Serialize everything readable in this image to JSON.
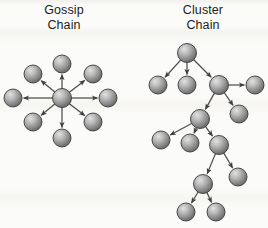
{
  "figure": {
    "background_color": "#fbfbf9",
    "node_fill_light": "#d6d6d6",
    "node_fill_dark": "#6f6f6f",
    "node_stroke": "#3a3a3a",
    "edge_color": "#4d4d4d"
  },
  "panels": [
    {
      "id": "gossip",
      "title": "Gossip\nChain",
      "title_line1": "Gossip",
      "title_line2": "Chain",
      "diagram_type": "star",
      "node_radius": 9,
      "hub": {
        "id": "hub",
        "x": 62,
        "y": 98,
        "r": 9.5
      },
      "satellites": [
        {
          "id": "g-n",
          "x": 62,
          "y": 64,
          "r": 9
        },
        {
          "id": "g-ne",
          "x": 93,
          "y": 74,
          "r": 9
        },
        {
          "id": "g-e",
          "x": 108,
          "y": 98,
          "r": 9
        },
        {
          "id": "g-se",
          "x": 93,
          "y": 122,
          "r": 9
        },
        {
          "id": "g-s",
          "x": 62,
          "y": 138,
          "r": 9
        },
        {
          "id": "g-sw",
          "x": 33,
          "y": 122,
          "r": 9
        },
        {
          "id": "g-w",
          "x": 13,
          "y": 98,
          "r": 9
        },
        {
          "id": "g-nw",
          "x": 33,
          "y": 74,
          "r": 9
        }
      ],
      "edges": [
        {
          "from": "hub",
          "to": "g-n",
          "arrow": true
        },
        {
          "from": "hub",
          "to": "g-ne",
          "arrow": true
        },
        {
          "from": "hub",
          "to": "g-e",
          "arrow": true
        },
        {
          "from": "hub",
          "to": "g-se",
          "arrow": true
        },
        {
          "from": "hub",
          "to": "g-s",
          "arrow": true
        },
        {
          "from": "hub",
          "to": "g-sw",
          "arrow": true
        },
        {
          "from": "hub",
          "to": "g-w",
          "arrow": true
        },
        {
          "from": "hub",
          "to": "g-nw",
          "arrow": true
        }
      ]
    },
    {
      "id": "cluster",
      "title": "Cluster\nChain",
      "title_line1": "Cluster",
      "title_line2": "Chain",
      "diagram_type": "tree",
      "node_radius": 9,
      "nodes": [
        {
          "id": "c-root",
          "x": 187,
          "y": 53,
          "r": 9.5
        },
        {
          "id": "c-a",
          "x": 158,
          "y": 85,
          "r": 9
        },
        {
          "id": "c-b",
          "x": 187,
          "y": 85,
          "r": 9
        },
        {
          "id": "c-c",
          "x": 219,
          "y": 85,
          "r": 9.5
        },
        {
          "id": "c-d",
          "x": 255,
          "y": 85,
          "r": 9
        },
        {
          "id": "c-e",
          "x": 200,
          "y": 119,
          "r": 9.5
        },
        {
          "id": "c-f",
          "x": 239,
          "y": 114,
          "r": 9
        },
        {
          "id": "c-g",
          "x": 161,
          "y": 140,
          "r": 9
        },
        {
          "id": "c-h",
          "x": 190,
          "y": 143,
          "r": 9
        },
        {
          "id": "c-i",
          "x": 219,
          "y": 145,
          "r": 9.5
        },
        {
          "id": "c-j",
          "x": 203,
          "y": 184,
          "r": 9.5
        },
        {
          "id": "c-k",
          "x": 238,
          "y": 177,
          "r": 9
        },
        {
          "id": "c-l",
          "x": 186,
          "y": 212,
          "r": 9
        },
        {
          "id": "c-m",
          "x": 216,
          "y": 212,
          "r": 9
        }
      ],
      "edges": [
        {
          "from": "c-root",
          "to": "c-a",
          "arrow": true
        },
        {
          "from": "c-root",
          "to": "c-b",
          "arrow": true
        },
        {
          "from": "c-root",
          "to": "c-c",
          "arrow": true
        },
        {
          "from": "c-c",
          "to": "c-d",
          "arrow": true
        },
        {
          "from": "c-c",
          "to": "c-e",
          "arrow": true
        },
        {
          "from": "c-c",
          "to": "c-f",
          "arrow": true
        },
        {
          "from": "c-e",
          "to": "c-g",
          "arrow": true
        },
        {
          "from": "c-e",
          "to": "c-h",
          "arrow": true
        },
        {
          "from": "c-e",
          "to": "c-i",
          "arrow": true
        },
        {
          "from": "c-i",
          "to": "c-j",
          "arrow": true
        },
        {
          "from": "c-i",
          "to": "c-k",
          "arrow": true
        },
        {
          "from": "c-j",
          "to": "c-l",
          "arrow": true
        },
        {
          "from": "c-j",
          "to": "c-m",
          "arrow": true
        }
      ]
    }
  ]
}
